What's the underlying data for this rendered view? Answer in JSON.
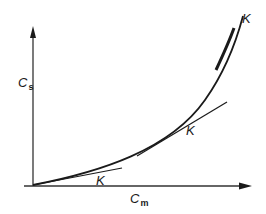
{
  "diagram": {
    "y_axis": {
      "label": "C",
      "subscript": "s"
    },
    "x_axis": {
      "label": "C",
      "subscript": "m"
    },
    "curve_labels": [
      "K",
      "K",
      "K"
    ],
    "colors": {
      "ink": "#1a1a1a",
      "background": "#ffffff"
    }
  }
}
